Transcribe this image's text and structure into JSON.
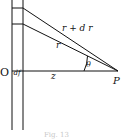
{
  "diagram": {
    "labels": {
      "origin": "O",
      "slab_thickness": "df",
      "distance": "z",
      "point": "P",
      "near_ray": "r",
      "far_ray": "r + d r",
      "angle": "θ"
    },
    "caption": "Fig. 13",
    "ink_color": "#111111"
  }
}
